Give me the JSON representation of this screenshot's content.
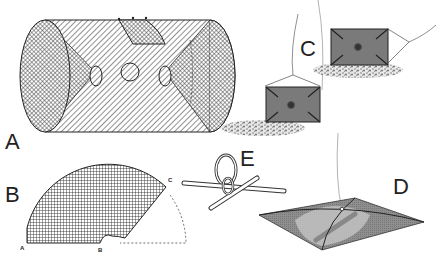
{
  "figure": {
    "panels": [
      {
        "id": "A",
        "label": "A",
        "description": "Cylindrical mesh trap with funnel entrances at both ends and a hatch on top"
      },
      {
        "id": "B",
        "label": "B",
        "description": "Flat pattern of funnel netting (sector shape)",
        "points": [
          "A",
          "B",
          "C"
        ]
      },
      {
        "id": "C",
        "label": "C",
        "description": "Rectangular weighted traps resting on bottom, attached to line"
      },
      {
        "id": "D",
        "label": "D",
        "description": "Square lift net spread on crossed hoops, suspended from line"
      },
      {
        "id": "E",
        "label": "E",
        "description": "Ring joint connecting crossed rods"
      }
    ],
    "colors": {
      "line": "#222222",
      "box_fill": "#7a7a7a",
      "net_fill": "#9a9a9a",
      "net_light": "#c4c4c4",
      "gravel": "#888888",
      "background": "#ffffff"
    }
  }
}
